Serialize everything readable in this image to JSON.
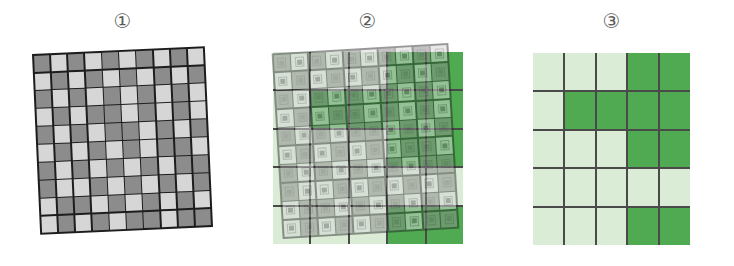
{
  "figure": {
    "background_color": "#ffffff",
    "width": 734,
    "height": 266
  },
  "colors": {
    "fine_dark_gray": "#8c8c8c",
    "fine_light_gray": "#d6d6d6",
    "fine_gridline": "#1d1d1d",
    "coarse_dark_green": "#4faa52",
    "coarse_light_green": "#daecd6",
    "coarse_gridline": "#4a4a4a",
    "label_text": "#5b5b5b"
  },
  "panels": [
    {
      "id": "panel-1",
      "label": "①",
      "label_name": "circled-one",
      "description": "rotated fine grid",
      "layers": [
        "fine-grid"
      ],
      "rotation_deg": -2.6
    },
    {
      "id": "panel-2",
      "label": "②",
      "label_name": "circled-two",
      "description": "fine grid overlaid on coarse grid",
      "layers": [
        "coarse-grid",
        "fine-grid-overlay"
      ],
      "rotation_deg": -3.4,
      "overlay_opacity": 0.52
    },
    {
      "id": "panel-3",
      "label": "③",
      "label_name": "circled-three",
      "description": "coarse grid result",
      "layers": [
        "coarse-grid"
      ],
      "rotation_deg": 0
    }
  ],
  "chart_data": {
    "type": "heatmap",
    "title": "",
    "xlabel": "",
    "ylabel": "",
    "grid": true,
    "legend": "none",
    "panel_labels": [
      "①",
      "②",
      "③"
    ],
    "fine_grid": {
      "rows": 10,
      "cols": 10,
      "value_labels": {
        "1": "dark-gray",
        "0": "light-gray"
      },
      "values": [
        [
          1,
          0,
          1,
          0,
          1,
          0,
          1,
          0,
          1,
          0
        ],
        [
          0,
          1,
          0,
          1,
          0,
          1,
          0,
          1,
          0,
          1
        ],
        [
          1,
          0,
          1,
          0,
          1,
          0,
          1,
          0,
          1,
          0
        ],
        [
          0,
          1,
          0,
          1,
          1,
          0,
          1,
          0,
          1,
          0
        ],
        [
          1,
          0,
          1,
          0,
          1,
          1,
          0,
          1,
          0,
          1
        ],
        [
          0,
          1,
          0,
          1,
          0,
          1,
          0,
          1,
          1,
          0
        ],
        [
          1,
          0,
          1,
          0,
          1,
          0,
          1,
          0,
          1,
          1
        ],
        [
          1,
          0,
          0,
          1,
          0,
          1,
          0,
          1,
          0,
          1
        ],
        [
          0,
          1,
          1,
          0,
          1,
          0,
          1,
          0,
          1,
          0
        ],
        [
          0,
          1,
          0,
          1,
          0,
          1,
          1,
          0,
          1,
          1
        ]
      ]
    },
    "coarse_grid": {
      "rows": 5,
      "cols": 5,
      "value_labels": {
        "1": "dark-green",
        "0": "light-green"
      },
      "values": [
        [
          0,
          0,
          0,
          1,
          1
        ],
        [
          0,
          1,
          1,
          1,
          1
        ],
        [
          0,
          0,
          0,
          1,
          1
        ],
        [
          0,
          0,
          0,
          0,
          0
        ],
        [
          0,
          0,
          0,
          1,
          1
        ]
      ]
    }
  }
}
